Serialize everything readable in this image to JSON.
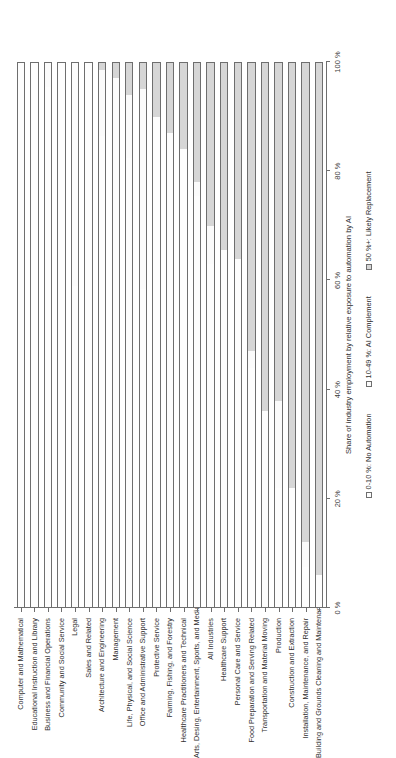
{
  "chart_data": {
    "type": "bar",
    "orientation": "horizontal-stacked",
    "title": "",
    "xlabel": "Share of industry employment by relative exposure to automation by AI",
    "ylabel": "",
    "xlim": [
      0,
      100
    ],
    "xticks": [
      "0 %",
      "20 %",
      "40 %",
      "60 %",
      "80 %",
      "100 %"
    ],
    "xtick_values": [
      0,
      20,
      40,
      60,
      80,
      100
    ],
    "grid": false,
    "legend_position": "bottom",
    "stacked_total": 100,
    "categories": [
      "Computer and Mathematical",
      "Educational Instruction and Library",
      "Business and Financial Operations",
      "Community and Social Service",
      "Legal",
      "Sales and Related",
      "Architecture and Engineering",
      "Management",
      "Life, Physical, and Social Science",
      "Office and Administrative Support",
      "Protective Service",
      "Farming, Fishing, and Forestry",
      "Healthcare Practitioners and Technical",
      "Arts, Desing, Entertainment, Sports, and Media",
      "All Industries",
      "Healthcare Support",
      "Personal Care and Service",
      "Food Preparation and Serving Related",
      "Transportation and Material Moving",
      "Production",
      "Construction and Extraction",
      "Installation, Maintenance, and Repair",
      "Building and Grounds Cleaning and Maintenance"
    ],
    "series": [
      {
        "name": "0-10 %: No Automation",
        "color": "#fdfdfd",
        "values": [
          100,
          100,
          96,
          100,
          100,
          100,
          89.5,
          86.5,
          93.5,
          79.5,
          100,
          100,
          100,
          99,
          95.5,
          100,
          95.5,
          100,
          100,
          93.5,
          100,
          89.5,
          0
        ]
      },
      {
        "name": "10-49 %: AI Complement",
        "color": "#fbfbfb",
        "values": [
          0,
          0,
          4,
          0,
          0,
          0,
          9,
          11.5,
          6.5,
          20.5,
          0,
          0,
          0,
          1,
          4.5,
          0,
          4.5,
          0,
          0,
          6.5,
          0,
          10.5,
          0
        ]
      },
      {
        "name": "50 %+: Likely Replacement",
        "color": "#d6d6d6",
        "values": [
          0,
          0,
          0,
          0,
          0,
          0,
          1.5,
          2,
          0,
          0,
          0,
          0,
          0,
          0,
          0,
          0,
          0,
          0,
          0,
          0,
          0,
          0,
          0
        ]
      }
    ],
    "bars": [
      {
        "category": "Computer and Mathematical",
        "no_automation": 100,
        "ai_complement": 0,
        "likely_replacement": 0
      },
      {
        "category": "Educational Instruction and Library",
        "no_automation": 100,
        "ai_complement": 0,
        "likely_replacement": 0
      },
      {
        "category": "Business and Financial Operations",
        "no_automation": 95.5,
        "ai_complement": 4.5,
        "likely_replacement": 0
      },
      {
        "category": "Community and Social Service",
        "no_automation": 100,
        "ai_complement": 0,
        "likely_replacement": 0
      },
      {
        "category": "Legal",
        "no_automation": 59,
        "ai_complement": 41,
        "likely_replacement": 0
      },
      {
        "category": "Sales and Related",
        "no_automation": 100,
        "ai_complement": 0,
        "likely_replacement": 0
      },
      {
        "category": "Architecture and Engineering",
        "no_automation": 86.5,
        "ai_complement": 12,
        "likely_replacement": 1.5
      },
      {
        "category": "Management",
        "no_automation": 97,
        "ai_complement": 0,
        "likely_replacement": 3
      },
      {
        "category": "Life, Physical, and Social Science",
        "no_automation": 82.5,
        "ai_complement": 11.5,
        "likely_replacement": 6
      },
      {
        "category": "Office and Administrative Support",
        "no_automation": 58.5,
        "ai_complement": 36.5,
        "likely_replacement": 5
      },
      {
        "category": "Protective Service",
        "no_automation": 90,
        "ai_complement": 0,
        "likely_replacement": 10
      },
      {
        "category": "Farming, Fishing, and Forestry",
        "no_automation": 87,
        "ai_complement": 0,
        "likely_replacement": 13
      },
      {
        "category": "Healthcare Practitioners and Technical",
        "no_automation": 84,
        "ai_complement": 0,
        "likely_replacement": 16
      },
      {
        "category": "Arts, Desing, Entertainment, Sports, and Media",
        "no_automation": 75.5,
        "ai_complement": 2.5,
        "likely_replacement": 22
      },
      {
        "category": "All Industries",
        "no_automation": 63,
        "ai_complement": 7,
        "likely_replacement": 30
      },
      {
        "category": "Healthcare Support",
        "no_automation": 65.5,
        "ai_complement": 0,
        "likely_replacement": 34.5
      },
      {
        "category": "Personal Care and Service",
        "no_automation": 64,
        "ai_complement": 0,
        "likely_replacement": 36
      },
      {
        "category": "Food Preparation and Serving Related",
        "no_automation": 44,
        "ai_complement": 3,
        "likely_replacement": 53
      },
      {
        "category": "Transportation and Material Moving",
        "no_automation": 36,
        "ai_complement": 0,
        "likely_replacement": 64
      },
      {
        "category": "Production",
        "no_automation": 22,
        "ai_complement": 16,
        "likely_replacement": 62
      },
      {
        "category": "Construction and Extraction",
        "no_automation": 22,
        "ai_complement": 0,
        "likely_replacement": 78
      },
      {
        "category": "Installation, Maintenance, and Repair",
        "no_automation": 7.5,
        "ai_complement": 4.5,
        "likely_replacement": 88
      },
      {
        "category": "Building and Grounds Cleaning and Maintenance",
        "no_automation": 6,
        "ai_complement": 0,
        "likely_replacement": 94
      }
    ]
  },
  "axis": {
    "x_title": "Share of industry employment by relative exposure to automation by AI",
    "ticks": [
      "0 %",
      "20 %",
      "40 %",
      "60 %",
      "80 %",
      "100 %"
    ]
  },
  "legend": {
    "items": [
      {
        "label": "0-10 %: No Automation",
        "color": "#fdfdfd"
      },
      {
        "label": "10-49 %: AI Complement",
        "color": "#fbfbfb"
      },
      {
        "label": "50 %+: Likely Replacement",
        "color": "#d6d6d6"
      }
    ]
  },
  "colors": {
    "outline": "#6e6e6e",
    "text": "#2f2f2f",
    "background": "#ffffff"
  }
}
